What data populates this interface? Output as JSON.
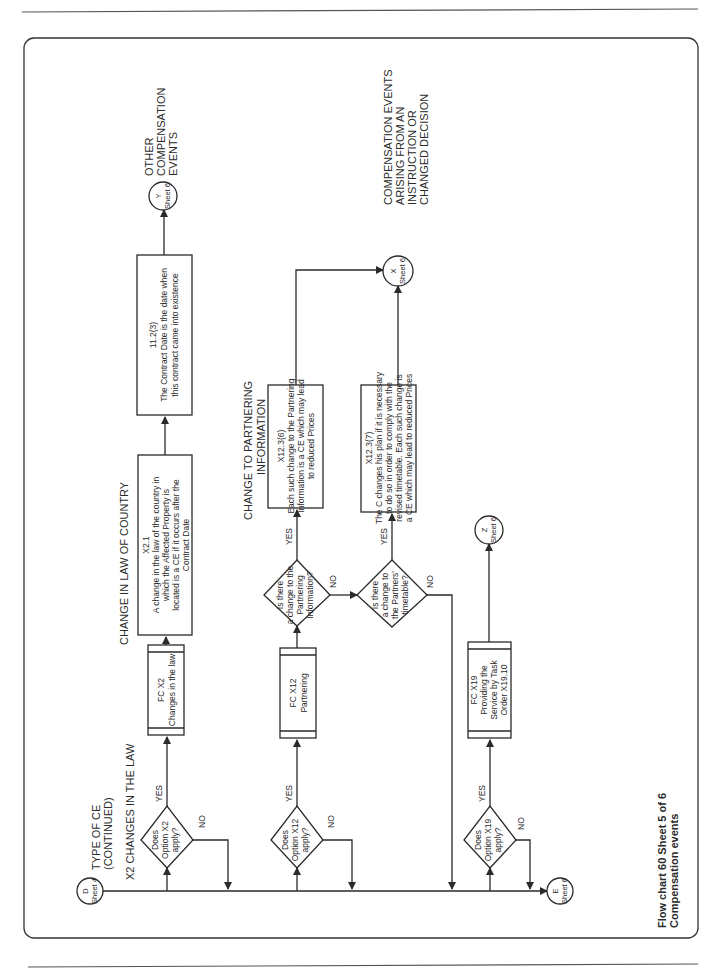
{
  "caption": {
    "line1": "Flow chart 60 Sheet 5 of 6",
    "line2": "Compensation events"
  },
  "headings": {
    "type_of_ce_1": "TYPE OF CE",
    "type_of_ce_2": "(CONTINUED)",
    "x2_changes": "X2 CHANGES IN THE LAW",
    "change_law_country": "CHANGE IN LAW OF COUNTRY",
    "change_partnering_1": "CHANGE TO PARTNERING",
    "change_partnering_2": "INFORMATION"
  },
  "connectors": {
    "d": {
      "letter": "D",
      "sheet": "Sheet 4"
    },
    "e": {
      "letter": "E",
      "sheet": "Sheet 6"
    },
    "y": {
      "letter": "Y",
      "sheet": "Sheet 6",
      "label": [
        "OTHER",
        "COMPENSATION",
        "EVENTS"
      ]
    },
    "x": {
      "letter": "X",
      "sheet": "Sheet 6",
      "label": [
        "COMPENSATION EVENTS",
        "ARISING FROM AN",
        "INSTRUCTION OR",
        "CHANGED DECISION"
      ]
    },
    "z": {
      "letter": "Z",
      "sheet": "Sheet 6"
    }
  },
  "decisions": {
    "x2": [
      "Does",
      "Option X2",
      "apply?"
    ],
    "x12": [
      "Does",
      "Option X12",
      "apply?"
    ],
    "x19": [
      "Does",
      "Option X19",
      "apply?"
    ],
    "partnering_info": [
      "Is there",
      "a change to the",
      "Partnering",
      "Information?"
    ],
    "partners_timetable": [
      "Is there",
      "a change to",
      "the Partners'",
      "timetable?"
    ]
  },
  "branch_labels": {
    "yes": "YES",
    "no": "NO"
  },
  "subprocesses": {
    "fc_x2": [
      "FC X2",
      "Changes in the law"
    ],
    "fc_x12": [
      "FC X12",
      "Partnering"
    ],
    "fc_x19": [
      "FC X19",
      "Providing the",
      "Service by Task",
      "Order X19.10"
    ]
  },
  "processes": {
    "x2_1": [
      "X2.1",
      "A change in the law of the country in",
      "which the Affected Property is",
      "located is a CE if it occurs after the",
      "Contract Date"
    ],
    "c11_2_3": [
      "11.2(3)",
      "The Contract Date is the date when",
      "this contract came into existence"
    ],
    "x12_3_6": [
      "X12.3(6)",
      "Each such change to the Partnering",
      "Information is a CE which may lead",
      "to reduced Prices"
    ],
    "x12_3_7": [
      "X12.3(7)",
      "The C changes his plan if it is necessary",
      "to do so in order to comply with the",
      "revised timetable. Each such change is",
      "a CE which may lead to reduced Prices"
    ]
  }
}
